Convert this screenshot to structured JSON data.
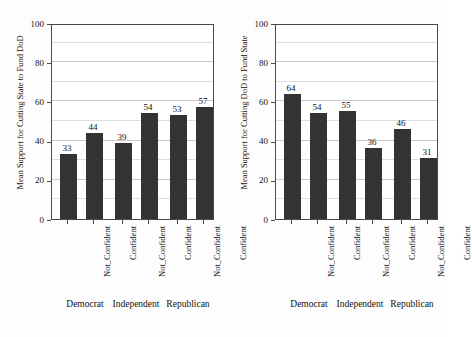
{
  "figure": {
    "background": "#fdfdfd",
    "bar_color": "#333333",
    "frame_color": "#4a4a4a",
    "grid_color": "#c9c9c9"
  },
  "chart_data": [
    {
      "panel": "left",
      "type": "bar",
      "title": "",
      "xlabel": "",
      "ylabel": "Mean Support for Cutting State to Fund DoD",
      "ylim": [
        0,
        100
      ],
      "yticks": [
        0,
        20,
        40,
        60,
        80,
        100
      ],
      "ytick_labels": [
        "0",
        "20",
        "40",
        "60",
        "80",
        "100"
      ],
      "grid": true,
      "minor_gridlines": [
        10,
        30,
        50,
        70,
        90
      ],
      "legend": "none",
      "groups": [
        "Democrat",
        "Independent",
        "Republican"
      ],
      "categories": [
        "Not_Confident",
        "Confident",
        "Not_Confident",
        "Confident",
        "Not_Confident",
        "Confident"
      ],
      "values": [
        33,
        44,
        39,
        54,
        53,
        57
      ],
      "data_labels": [
        "33",
        "44",
        "39",
        "54",
        "53",
        "57"
      ]
    },
    {
      "panel": "right",
      "type": "bar",
      "title": "",
      "xlabel": "",
      "ylabel": "Mean Support for Cutting DoD to Fund State",
      "ylim": [
        0,
        100
      ],
      "yticks": [
        0,
        20,
        40,
        60,
        80,
        100
      ],
      "ytick_labels": [
        "0",
        "20",
        "40",
        "60",
        "80",
        "100"
      ],
      "grid": true,
      "minor_gridlines": [
        10,
        30,
        50,
        70,
        90
      ],
      "legend": "none",
      "groups": [
        "Democrat",
        "Independent",
        "Republican"
      ],
      "categories": [
        "Not_Confident",
        "Confident",
        "Not_Confident",
        "Confident",
        "Not_Confident",
        "Confident"
      ],
      "values": [
        64,
        54,
        55,
        36,
        46,
        31
      ],
      "data_labels": [
        "64",
        "54",
        "55",
        "36",
        "46",
        "31"
      ]
    }
  ]
}
